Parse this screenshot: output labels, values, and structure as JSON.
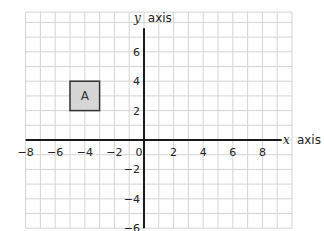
{
  "chart_data": {
    "type": "scatter",
    "title": "",
    "xlabel": "x axis",
    "ylabel": "y axis",
    "x_axis_variable": "x",
    "x_axis_word": "axis",
    "y_axis_variable": "y",
    "y_axis_word": "axis",
    "xlim": [
      -8,
      10
    ],
    "ylim": [
      -6,
      8.7
    ],
    "grid": true,
    "grid_step": 1,
    "x_ticks": [
      {
        "value": -8,
        "label": "−8"
      },
      {
        "value": -6,
        "label": "−6"
      },
      {
        "value": -4,
        "label": "−4"
      },
      {
        "value": -2,
        "label": "−2"
      },
      {
        "value": 0,
        "label": "0"
      },
      {
        "value": 2,
        "label": "2"
      },
      {
        "value": 4,
        "label": "4"
      },
      {
        "value": 6,
        "label": "6"
      },
      {
        "value": 8,
        "label": "8"
      }
    ],
    "y_ticks": [
      {
        "value": 6,
        "label": "6"
      },
      {
        "value": 4,
        "label": "4"
      },
      {
        "value": 2,
        "label": "2"
      },
      {
        "value": -2,
        "label": "−2"
      },
      {
        "value": -4,
        "label": "−4"
      },
      {
        "value": -6,
        "label": "−6"
      }
    ],
    "shapes": [
      {
        "label": "A",
        "type": "square",
        "x_min": -5,
        "x_max": -3,
        "y_min": 2,
        "y_max": 4,
        "fill": "#d6d6d6",
        "stroke": "#333333"
      }
    ]
  },
  "colors": {
    "grid": "#d4d4d4",
    "axis": "#1a1a1a",
    "shape_fill": "#d6d6d6"
  }
}
